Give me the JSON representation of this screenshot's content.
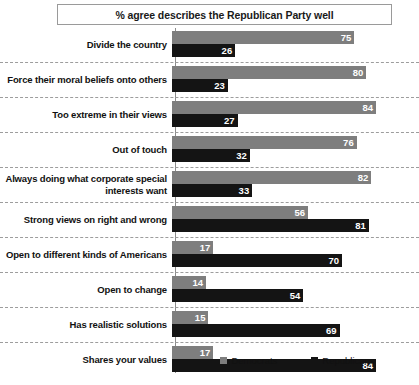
{
  "chart_data": {
    "type": "bar",
    "orientation": "horizontal",
    "title": "% agree describes the Republican Party well",
    "xlabel": "",
    "ylabel": "",
    "xlim": [
      0,
      100
    ],
    "grid": false,
    "legend_position": "bottom",
    "categories": [
      "Divide the country",
      "Force their moral beliefs onto others",
      "Too extreme in their views",
      "Out of touch",
      "Always doing what corporate special interests want",
      "Strong views on right and wrong",
      "Open to different kinds of Americans",
      "Open to change",
      "Has realistic solutions",
      "Shares your values"
    ],
    "series": [
      {
        "name": "Democrats",
        "color": "#7e7e7e",
        "values": [
          75,
          80,
          84,
          76,
          82,
          56,
          17,
          14,
          15,
          17
        ]
      },
      {
        "name": "Republicans",
        "color": "#141414",
        "values": [
          26,
          23,
          27,
          32,
          33,
          81,
          70,
          54,
          69,
          84
        ]
      }
    ]
  },
  "legend": {
    "items": [
      {
        "label": "Democrats",
        "swatch": "democrats-swatch"
      },
      {
        "label": "Republicans",
        "swatch": "republicans-swatch"
      }
    ]
  }
}
